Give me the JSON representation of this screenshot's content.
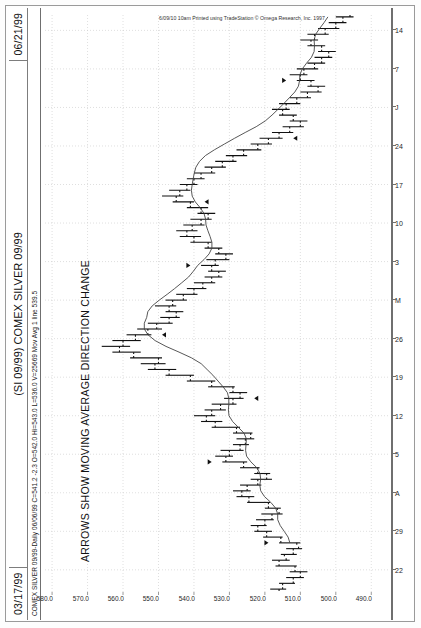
{
  "window": {
    "date_left": "03/17/99",
    "date_right": "06/21/99",
    "title": "(SI 09/99) COMEX SILVER 09/99",
    "quote_line": "COMEX SILVER 09/99-Daily  06/06/99  C=541.2  -2.3  O=542.0  Hi=543.0  L=536.0  V=25669  Mov Avg 1 line   539.5",
    "annotation": "ARROWS SHOW MOVING AVERAGE DIRECTION CHANGE",
    "copyright": "6/09/10 10am Printed using TradeStation © Omega Research, Inc. 1997"
  },
  "colors": {
    "frame": "#7d7d7d",
    "axis": "#6f6f6f",
    "grid": "#c9c9c9",
    "bar": "#111111",
    "ma_line": "#444444",
    "background": "#ffffff"
  },
  "chart_data": {
    "type": "ohlc",
    "title": "(SI 09/99) COMEX SILVER 09/99",
    "subtitle": "ARROWS SHOW MOVING AVERAGE DIRECTION CHANGE",
    "xlabel": "",
    "ylabel": "",
    "grid": true,
    "legend": "none",
    "orientation": "rotated-90",
    "ylim": [
      485.0,
      582.0
    ],
    "ytick_labels": [
      "580.0",
      "570.0",
      "560.0",
      "550.0",
      "540.0",
      "530.0",
      "520.0",
      "510.0",
      "500.0",
      "490.0"
    ],
    "ytick_values": [
      580.0,
      570.0,
      560.0,
      550.0,
      540.0,
      530.0,
      520.0,
      510.0,
      500.0,
      490.0
    ],
    "xtick_labels": [
      "22",
      "29",
      "A",
      "5",
      "12",
      "19",
      "26",
      "M",
      "3",
      "10",
      "17",
      "24",
      "J",
      "7",
      "14"
    ],
    "x_date_range": [
      "03/17/99",
      "06/21/99"
    ],
    "overlays": [
      {
        "name": "Mov Avg 1 line",
        "type": "line",
        "last_value": 539.5
      }
    ],
    "last_quote": {
      "symbol": "COMEX SILVER 09/99-Daily",
      "date": "06/06/99",
      "close": 541.2,
      "change": -2.3,
      "open": 542.0,
      "high": 543.0,
      "low": 536.0,
      "volume": 25669
    },
    "bars": [
      {
        "t": 0,
        "o": 516.0,
        "h": 518.5,
        "l": 514.0,
        "c": 515.0
      },
      {
        "t": 1,
        "o": 515.0,
        "h": 516.0,
        "l": 511.5,
        "c": 512.0
      },
      {
        "t": 2,
        "o": 512.0,
        "h": 514.0,
        "l": 509.0,
        "c": 510.0
      },
      {
        "t": 3,
        "o": 510.0,
        "h": 513.0,
        "l": 508.0,
        "c": 511.5
      },
      {
        "t": 4,
        "o": 511.5,
        "h": 517.0,
        "l": 511.0,
        "c": 516.0
      },
      {
        "t": 5,
        "o": 516.0,
        "h": 518.0,
        "l": 513.0,
        "c": 514.0
      },
      {
        "t": 6,
        "o": 514.5,
        "h": 515.5,
        "l": 511.0,
        "c": 512.0
      },
      {
        "t": 7,
        "o": 512.0,
        "h": 514.0,
        "l": 509.5,
        "c": 510.5
      },
      {
        "t": 8,
        "o": 511.0,
        "h": 516.0,
        "l": 510.0,
        "c": 515.5
      },
      {
        "t": 9,
        "o": 515.5,
        "h": 520.5,
        "l": 515.0,
        "c": 519.5
      },
      {
        "t": 10,
        "o": 519.5,
        "h": 523.0,
        "l": 518.0,
        "c": 522.0
      },
      {
        "t": 11,
        "o": 522.0,
        "h": 524.0,
        "l": 519.5,
        "c": 520.0
      },
      {
        "t": 12,
        "o": 520.0,
        "h": 522.5,
        "l": 517.5,
        "c": 518.0
      },
      {
        "t": 13,
        "o": 518.0,
        "h": 521.0,
        "l": 515.0,
        "c": 516.0
      },
      {
        "t": 14,
        "o": 516.5,
        "h": 520.0,
        "l": 515.5,
        "c": 519.0
      },
      {
        "t": 15,
        "o": 519.0,
        "h": 525.0,
        "l": 518.5,
        "c": 524.5
      },
      {
        "t": 16,
        "o": 524.5,
        "h": 528.0,
        "l": 523.0,
        "c": 526.5
      },
      {
        "t": 17,
        "o": 526.5,
        "h": 529.0,
        "l": 524.0,
        "c": 525.0
      },
      {
        "t": 18,
        "o": 525.0,
        "h": 527.0,
        "l": 521.0,
        "c": 522.0
      },
      {
        "t": 19,
        "o": 522.0,
        "h": 524.0,
        "l": 518.0,
        "c": 519.5
      },
      {
        "t": 20,
        "o": 519.5,
        "h": 523.0,
        "l": 518.5,
        "c": 522.0
      },
      {
        "t": 21,
        "o": 522.0,
        "h": 527.0,
        "l": 521.5,
        "c": 526.0
      },
      {
        "t": 22,
        "o": 526.0,
        "h": 532.0,
        "l": 525.0,
        "c": 531.0
      },
      {
        "t": 23,
        "o": 531.0,
        "h": 534.0,
        "l": 529.0,
        "c": 530.0
      },
      {
        "t": 24,
        "o": 530.0,
        "h": 532.5,
        "l": 526.0,
        "c": 527.0
      },
      {
        "t": 25,
        "o": 527.0,
        "h": 529.0,
        "l": 524.5,
        "c": 525.5
      },
      {
        "t": 26,
        "o": 525.5,
        "h": 528.0,
        "l": 523.0,
        "c": 524.0
      },
      {
        "t": 27,
        "o": 524.0,
        "h": 529.0,
        "l": 523.5,
        "c": 528.0
      },
      {
        "t": 28,
        "o": 528.0,
        "h": 535.0,
        "l": 527.0,
        "c": 534.0
      },
      {
        "t": 29,
        "o": 534.0,
        "h": 538.0,
        "l": 532.0,
        "c": 536.5
      },
      {
        "t": 30,
        "o": 536.5,
        "h": 540.0,
        "l": 534.0,
        "c": 535.0
      },
      {
        "t": 31,
        "o": 535.0,
        "h": 537.0,
        "l": 531.0,
        "c": 532.5
      },
      {
        "t": 32,
        "o": 532.5,
        "h": 535.0,
        "l": 528.0,
        "c": 529.0
      },
      {
        "t": 33,
        "o": 529.0,
        "h": 531.5,
        "l": 526.0,
        "c": 527.0
      },
      {
        "t": 34,
        "o": 527.0,
        "h": 530.0,
        "l": 525.0,
        "c": 529.0
      },
      {
        "t": 35,
        "o": 529.0,
        "h": 536.0,
        "l": 528.5,
        "c": 535.0
      },
      {
        "t": 36,
        "o": 535.0,
        "h": 542.0,
        "l": 534.0,
        "c": 541.0
      },
      {
        "t": 37,
        "o": 541.0,
        "h": 548.0,
        "l": 540.0,
        "c": 547.0
      },
      {
        "t": 38,
        "o": 547.0,
        "h": 553.0,
        "l": 545.0,
        "c": 551.0
      },
      {
        "t": 39,
        "o": 551.0,
        "h": 555.0,
        "l": 548.0,
        "c": 550.0
      },
      {
        "t": 40,
        "o": 550.0,
        "h": 558.0,
        "l": 549.0,
        "c": 557.0
      },
      {
        "t": 41,
        "o": 557.0,
        "h": 563.0,
        "l": 555.0,
        "c": 561.0
      },
      {
        "t": 42,
        "o": 561.0,
        "h": 566.0,
        "l": 558.0,
        "c": 560.0
      },
      {
        "t": 43,
        "o": 560.0,
        "h": 563.0,
        "l": 555.0,
        "c": 556.5
      },
      {
        "t": 44,
        "o": 556.5,
        "h": 559.0,
        "l": 552.0,
        "c": 553.0
      },
      {
        "t": 45,
        "o": 553.0,
        "h": 556.0,
        "l": 549.0,
        "c": 550.5
      },
      {
        "t": 46,
        "o": 550.5,
        "h": 553.0,
        "l": 546.0,
        "c": 547.0
      },
      {
        "t": 47,
        "o": 547.0,
        "h": 549.5,
        "l": 544.0,
        "c": 545.0
      },
      {
        "t": 48,
        "o": 545.0,
        "h": 548.0,
        "l": 543.0,
        "c": 547.0
      },
      {
        "t": 49,
        "o": 547.0,
        "h": 551.0,
        "l": 545.0,
        "c": 546.0
      },
      {
        "t": 50,
        "o": 546.0,
        "h": 548.0,
        "l": 542.0,
        "c": 543.0
      },
      {
        "t": 51,
        "o": 543.0,
        "h": 545.0,
        "l": 539.0,
        "c": 540.0
      },
      {
        "t": 52,
        "o": 540.0,
        "h": 542.0,
        "l": 536.5,
        "c": 537.5
      },
      {
        "t": 53,
        "o": 537.5,
        "h": 540.0,
        "l": 534.0,
        "c": 535.0
      },
      {
        "t": 54,
        "o": 535.0,
        "h": 537.0,
        "l": 532.0,
        "c": 533.0
      },
      {
        "t": 55,
        "o": 533.0,
        "h": 536.0,
        "l": 531.0,
        "c": 535.0
      },
      {
        "t": 56,
        "o": 535.0,
        "h": 538.0,
        "l": 533.0,
        "c": 534.0
      },
      {
        "t": 57,
        "o": 534.0,
        "h": 536.5,
        "l": 530.0,
        "c": 531.0
      },
      {
        "t": 58,
        "o": 531.0,
        "h": 534.0,
        "l": 529.0,
        "c": 533.0
      },
      {
        "t": 59,
        "o": 533.0,
        "h": 537.0,
        "l": 532.0,
        "c": 536.0
      },
      {
        "t": 60,
        "o": 536.0,
        "h": 541.0,
        "l": 535.0,
        "c": 540.0
      },
      {
        "t": 61,
        "o": 540.0,
        "h": 544.0,
        "l": 538.0,
        "c": 542.0
      },
      {
        "t": 62,
        "o": 542.0,
        "h": 545.0,
        "l": 539.0,
        "c": 540.5
      },
      {
        "t": 63,
        "o": 540.5,
        "h": 543.0,
        "l": 537.0,
        "c": 538.0
      },
      {
        "t": 64,
        "o": 538.0,
        "h": 541.0,
        "l": 535.0,
        "c": 536.0
      },
      {
        "t": 65,
        "o": 536.0,
        "h": 539.0,
        "l": 534.0,
        "c": 538.0
      },
      {
        "t": 66,
        "o": 538.0,
        "h": 542.0,
        "l": 536.0,
        "c": 541.0
      },
      {
        "t": 67,
        "o": 541.0,
        "h": 546.0,
        "l": 540.0,
        "c": 545.0
      },
      {
        "t": 68,
        "o": 545.0,
        "h": 549.0,
        "l": 543.0,
        "c": 544.0
      },
      {
        "t": 69,
        "o": 544.0,
        "h": 547.0,
        "l": 541.0,
        "c": 542.0
      },
      {
        "t": 70,
        "o": 542.0,
        "h": 544.0,
        "l": 539.0,
        "c": 540.0
      },
      {
        "t": 71,
        "o": 540.0,
        "h": 542.0,
        "l": 537.0,
        "c": 538.0
      },
      {
        "t": 72,
        "o": 538.0,
        "h": 540.0,
        "l": 534.0,
        "c": 535.0
      },
      {
        "t": 73,
        "o": 535.0,
        "h": 537.0,
        "l": 531.0,
        "c": 532.0
      },
      {
        "t": 74,
        "o": 532.0,
        "h": 534.0,
        "l": 528.0,
        "c": 529.0
      },
      {
        "t": 75,
        "o": 529.0,
        "h": 531.0,
        "l": 525.0,
        "c": 526.0
      },
      {
        "t": 76,
        "o": 526.0,
        "h": 528.0,
        "l": 521.0,
        "c": 522.0
      },
      {
        "t": 77,
        "o": 522.0,
        "h": 524.0,
        "l": 518.0,
        "c": 519.0
      },
      {
        "t": 78,
        "o": 519.0,
        "h": 521.5,
        "l": 515.0,
        "c": 516.0
      },
      {
        "t": 79,
        "o": 516.0,
        "h": 518.0,
        "l": 512.0,
        "c": 513.0
      },
      {
        "t": 80,
        "o": 513.0,
        "h": 515.0,
        "l": 509.0,
        "c": 510.0
      },
      {
        "t": 81,
        "o": 510.0,
        "h": 513.0,
        "l": 508.0,
        "c": 512.0
      },
      {
        "t": 82,
        "o": 512.0,
        "h": 516.0,
        "l": 511.0,
        "c": 515.0
      },
      {
        "t": 83,
        "o": 515.0,
        "h": 518.0,
        "l": 513.0,
        "c": 514.0
      },
      {
        "t": 84,
        "o": 514.0,
        "h": 516.0,
        "l": 510.0,
        "c": 511.0
      },
      {
        "t": 85,
        "o": 511.0,
        "h": 513.0,
        "l": 507.0,
        "c": 508.0
      },
      {
        "t": 86,
        "o": 508.0,
        "h": 510.0,
        "l": 504.0,
        "c": 505.0
      },
      {
        "t": 87,
        "o": 505.0,
        "h": 508.0,
        "l": 503.0,
        "c": 507.0
      },
      {
        "t": 88,
        "o": 507.0,
        "h": 511.0,
        "l": 506.0,
        "c": 510.0
      },
      {
        "t": 89,
        "o": 510.0,
        "h": 513.0,
        "l": 508.0,
        "c": 509.0
      },
      {
        "t": 90,
        "o": 509.0,
        "h": 511.0,
        "l": 505.0,
        "c": 506.0
      },
      {
        "t": 91,
        "o": 506.0,
        "h": 508.0,
        "l": 503.0,
        "c": 504.0
      },
      {
        "t": 92,
        "o": 504.0,
        "h": 506.0,
        "l": 501.0,
        "c": 502.0
      },
      {
        "t": 93,
        "o": 502.0,
        "h": 505.0,
        "l": 500.0,
        "c": 504.0
      },
      {
        "t": 94,
        "o": 504.0,
        "h": 508.0,
        "l": 503.0,
        "c": 507.0
      },
      {
        "t": 95,
        "o": 507.0,
        "h": 510.0,
        "l": 505.0,
        "c": 506.0
      },
      {
        "t": 96,
        "o": 506.0,
        "h": 508.0,
        "l": 502.0,
        "c": 503.0
      },
      {
        "t": 97,
        "o": 503.0,
        "h": 505.0,
        "l": 499.0,
        "c": 500.0
      },
      {
        "t": 98,
        "o": 500.0,
        "h": 502.0,
        "l": 497.0,
        "c": 498.0
      },
      {
        "t": 99,
        "o": 498.0,
        "h": 500.0,
        "l": 495.0,
        "c": 496.0
      }
    ],
    "arrows": [
      {
        "t": 8,
        "dir": "up"
      },
      {
        "t": 22,
        "dir": "up"
      },
      {
        "t": 33,
        "dir": "down"
      },
      {
        "t": 44,
        "dir": "down"
      },
      {
        "t": 56,
        "dir": "up"
      },
      {
        "t": 67,
        "dir": "down"
      },
      {
        "t": 78,
        "dir": "down"
      },
      {
        "t": 88,
        "dir": "up"
      }
    ]
  }
}
